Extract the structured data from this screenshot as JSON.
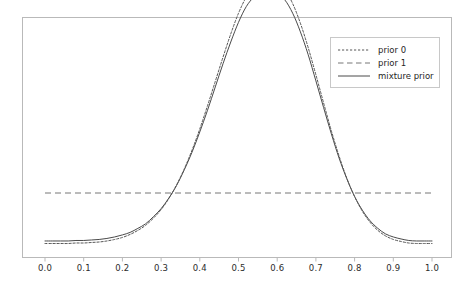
{
  "chart_data": {
    "type": "line",
    "title": "",
    "xlabel": "",
    "ylabel": "",
    "xlim": [
      0.0,
      1.0
    ],
    "ylim": [
      0.0,
      5.6
    ],
    "grid": false,
    "xticks": [
      "0.0",
      "0.1",
      "0.2",
      "0.3",
      "0.4",
      "0.5",
      "0.6",
      "0.7",
      "0.8",
      "0.9",
      "1.0"
    ],
    "xtick_values": [
      0.0,
      0.1,
      0.2,
      0.3,
      0.4,
      0.5,
      0.6,
      0.7,
      0.8,
      0.9,
      1.0
    ],
    "yticks": [],
    "legend_position": "upper right",
    "x": [
      0.0,
      0.02,
      0.04,
      0.06,
      0.08,
      0.1,
      0.12,
      0.14,
      0.16,
      0.18,
      0.2,
      0.22,
      0.24,
      0.26,
      0.28,
      0.3,
      0.32,
      0.34,
      0.36,
      0.38,
      0.4,
      0.42,
      0.44,
      0.46,
      0.48,
      0.5,
      0.52,
      0.54,
      0.56,
      0.58,
      0.6,
      0.62,
      0.64,
      0.66,
      0.68,
      0.7,
      0.72,
      0.74,
      0.76,
      0.78,
      0.8,
      0.82,
      0.84,
      0.86,
      0.88,
      0.9,
      0.92,
      0.94,
      0.96,
      0.98,
      1.0
    ],
    "series": [
      {
        "name": "prior 0",
        "style": "dotted",
        "color": "#555555",
        "peak_x": 0.6,
        "peak_y": 5.15,
        "values": [
          0.0,
          0.0,
          0.0,
          0.0,
          0.01,
          0.01,
          0.02,
          0.03,
          0.05,
          0.08,
          0.12,
          0.18,
          0.26,
          0.36,
          0.5,
          0.67,
          0.89,
          1.16,
          1.48,
          1.85,
          2.27,
          2.73,
          3.21,
          3.69,
          4.15,
          4.56,
          4.88,
          5.09,
          5.17,
          5.15,
          5.15,
          5.02,
          4.75,
          4.36,
          3.88,
          3.34,
          2.78,
          2.23,
          1.73,
          1.29,
          0.93,
          0.64,
          0.42,
          0.26,
          0.15,
          0.08,
          0.04,
          0.01,
          0.0,
          0.0,
          0.0
        ]
      },
      {
        "name": "prior 1",
        "style": "dashed",
        "color": "#777777",
        "constant": 1.0,
        "values": [
          1.0,
          1.0,
          1.0,
          1.0,
          1.0,
          1.0,
          1.0,
          1.0,
          1.0,
          1.0,
          1.0,
          1.0,
          1.0,
          1.0,
          1.0,
          1.0,
          1.0,
          1.0,
          1.0,
          1.0,
          1.0,
          1.0,
          1.0,
          1.0,
          1.0,
          1.0,
          1.0,
          1.0,
          1.0,
          1.0,
          1.0,
          1.0,
          1.0,
          1.0,
          1.0,
          1.0,
          1.0,
          1.0,
          1.0,
          1.0,
          1.0,
          1.0,
          1.0,
          1.0,
          1.0,
          1.0,
          1.0,
          1.0,
          1.0,
          1.0,
          1.0
        ]
      },
      {
        "name": "mixture prior",
        "style": "solid",
        "color": "#4a4a4a",
        "peak_x": 0.6,
        "peak_y": 4.92,
        "weight_prior0": 0.95,
        "weight_prior1": 0.05,
        "values": [
          0.05,
          0.05,
          0.05,
          0.05,
          0.06,
          0.06,
          0.07,
          0.08,
          0.1,
          0.13,
          0.17,
          0.22,
          0.3,
          0.39,
          0.53,
          0.69,
          0.9,
          1.15,
          1.46,
          1.81,
          2.21,
          2.64,
          3.1,
          3.56,
          3.99,
          4.38,
          4.69,
          4.88,
          4.96,
          4.94,
          4.94,
          4.82,
          4.56,
          4.19,
          3.74,
          3.22,
          2.69,
          2.17,
          1.69,
          1.28,
          0.93,
          0.66,
          0.45,
          0.3,
          0.19,
          0.13,
          0.09,
          0.06,
          0.05,
          0.05,
          0.05
        ]
      }
    ]
  },
  "legend": {
    "items": [
      {
        "label": "prior 0"
      },
      {
        "label": "prior 1"
      },
      {
        "label": "mixture prior"
      }
    ]
  },
  "axes": {
    "x_tick_labels": [
      "0.0",
      "0.1",
      "0.2",
      "0.3",
      "0.4",
      "0.5",
      "0.6",
      "0.7",
      "0.8",
      "0.9",
      "1.0"
    ]
  },
  "colors": {
    "frame": "#b9b9b9",
    "prior0": "#555555",
    "prior1": "#777777",
    "mixture": "#4a4a4a",
    "background": "#ffffff",
    "text": "#2b2b2b"
  }
}
